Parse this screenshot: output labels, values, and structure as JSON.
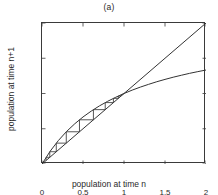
{
  "chart_data": {
    "type": "line",
    "title": "(a)",
    "xlabel": "population at time n",
    "ylabel": "population at time n+1",
    "xlim": [
      0,
      2
    ],
    "ylim": [
      0,
      2
    ],
    "grid": false,
    "legend": null,
    "xticks": [
      "0",
      "0.5",
      "1",
      "1.5",
      "2"
    ],
    "xtick_values": [
      0,
      0.5,
      1,
      1.5,
      2
    ],
    "yticks": [
      "0",
      "0.5",
      "1",
      "1.5",
      "2"
    ],
    "ytick_values": [
      0,
      0.5,
      1,
      1.5,
      2
    ],
    "line_color": "#333333",
    "series": [
      {
        "name": "identity line y = x",
        "type": "line",
        "x": [
          0,
          2
        ],
        "values": [
          0,
          2
        ]
      },
      {
        "name": "map f(x) = 2x/(1+x)",
        "type": "line",
        "x": [
          0,
          0.1,
          0.2,
          0.3,
          0.4,
          0.5,
          0.6,
          0.7,
          0.8,
          0.9,
          1.0,
          1.1,
          1.2,
          1.3,
          1.4,
          1.5,
          1.6,
          1.7,
          1.8,
          1.9,
          2.0
        ],
        "values": [
          0,
          0.182,
          0.333,
          0.462,
          0.571,
          0.667,
          0.75,
          0.824,
          0.889,
          0.947,
          1.0,
          1.048,
          1.091,
          1.13,
          1.167,
          1.2,
          1.231,
          1.259,
          1.286,
          1.31,
          1.333
        ]
      },
      {
        "name": "cobweb staircase",
        "type": "line",
        "note": "alternating vertical/horizontal steps from x0 toward fixed point at (1,1)",
        "x": [
          0.05,
          0.05,
          0.095,
          0.095,
          0.174,
          0.174,
          0.296,
          0.296,
          0.457,
          0.457,
          0.627,
          0.627,
          0.771,
          0.771,
          0.871,
          0.871,
          0.931,
          0.931,
          0.964,
          0.964,
          0.982,
          0.982,
          0.991
        ],
        "values": [
          0.05,
          0.095,
          0.095,
          0.174,
          0.174,
          0.296,
          0.296,
          0.457,
          0.457,
          0.627,
          0.627,
          0.771,
          0.771,
          0.871,
          0.871,
          0.931,
          0.931,
          0.964,
          0.964,
          0.982,
          0.982,
          0.991,
          0.991
        ]
      }
    ],
    "annotations": [
      {
        "text": "fixed point",
        "x": 1,
        "y": 1
      }
    ]
  }
}
